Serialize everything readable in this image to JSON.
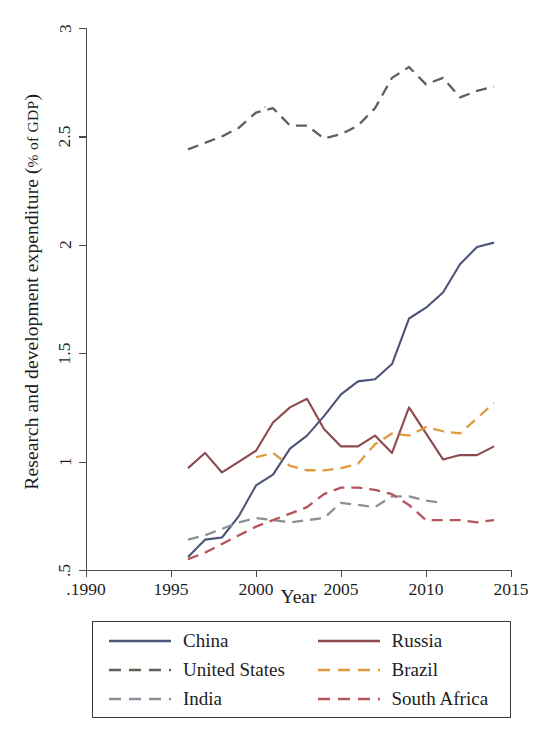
{
  "chart_data": {
    "type": "line",
    "title": "",
    "xlabel": "Year",
    "ylabel": "Research and development expenditure (% of GDP)",
    "ylabel_main": "Research and development expenditure (",
    "ylabel_smallcaps": "% of GDP",
    "ylabel_tail": ")",
    "xlim": [
      1990,
      2015
    ],
    "ylim": [
      0.5,
      3
    ],
    "grid": false,
    "legend_position": "bottom",
    "x_ticks": [
      ".1990",
      "1995",
      "2000",
      "2005",
      "2010",
      "2015"
    ],
    "x_tick_values": [
      1990,
      1995,
      2000,
      2005,
      2010,
      2015
    ],
    "y_ticks": [
      ".5",
      "1",
      "1.5",
      "2",
      "2.5",
      "3"
    ],
    "y_tick_values": [
      0.5,
      1,
      1.5,
      2,
      2.5,
      3
    ],
    "series": [
      {
        "name": "China",
        "color": "#4c5578",
        "style": "solid",
        "x": [
          1996,
          1997,
          1998,
          1999,
          2000,
          2001,
          2002,
          2003,
          2004,
          2005,
          2006,
          2007,
          2008,
          2009,
          2010,
          2011,
          2012,
          2013,
          2014
        ],
        "values": [
          0.56,
          0.64,
          0.65,
          0.75,
          0.89,
          0.94,
          1.06,
          1.12,
          1.21,
          1.31,
          1.37,
          1.38,
          1.45,
          1.66,
          1.71,
          1.78,
          1.91,
          1.99,
          2.01
        ]
      },
      {
        "name": "United States",
        "color": "#5d6052",
        "style": "dashed",
        "x": [
          1996,
          1997,
          1998,
          1999,
          2000,
          2001,
          2002,
          2003,
          2004,
          2005,
          2006,
          2007,
          2008,
          2009,
          2010,
          2011,
          2012,
          2013,
          2014
        ],
        "values": [
          2.44,
          2.47,
          2.5,
          2.54,
          2.61,
          2.63,
          2.55,
          2.55,
          2.49,
          2.51,
          2.55,
          2.63,
          2.77,
          2.82,
          2.74,
          2.77,
          2.68,
          2.71,
          2.73
        ]
      },
      {
        "name": "India",
        "color": "#8b8f99",
        "style": "dashed",
        "x": [
          1996,
          1997,
          1998,
          1999,
          2000,
          2001,
          2002,
          2003,
          2004,
          2005,
          2006,
          2007,
          2008,
          2009,
          2010,
          2011
        ],
        "values": [
          0.64,
          0.66,
          0.69,
          0.72,
          0.74,
          0.73,
          0.72,
          0.73,
          0.74,
          0.81,
          0.8,
          0.79,
          0.84,
          0.84,
          0.82,
          0.81
        ]
      },
      {
        "name": "Russia",
        "color": "#8c4a4e",
        "style": "solid",
        "x": [
          1996,
          1997,
          1998,
          1999,
          2000,
          2001,
          2002,
          2003,
          2004,
          2005,
          2006,
          2007,
          2008,
          2009,
          2010,
          2011,
          2012,
          2013,
          2014
        ],
        "values": [
          0.97,
          1.04,
          0.95,
          1.0,
          1.05,
          1.18,
          1.25,
          1.29,
          1.15,
          1.07,
          1.07,
          1.12,
          1.04,
          1.25,
          1.13,
          1.01,
          1.03,
          1.03,
          1.07
        ]
      },
      {
        "name": "Brazil",
        "color": "#e09a3e",
        "style": "dashed",
        "x": [
          2000,
          2001,
          2002,
          2003,
          2004,
          2005,
          2006,
          2007,
          2008,
          2009,
          2010,
          2011,
          2012,
          2013,
          2014
        ],
        "values": [
          1.02,
          1.04,
          0.98,
          0.96,
          0.96,
          0.97,
          0.99,
          1.08,
          1.13,
          1.12,
          1.16,
          1.14,
          1.13,
          1.2,
          1.27
        ]
      },
      {
        "name": "South Africa",
        "color": "#b4545c",
        "style": "dashed",
        "x": [
          1996,
          1997,
          1998,
          1999,
          2000,
          2001,
          2002,
          2003,
          2004,
          2005,
          2006,
          2007,
          2008,
          2009,
          2010,
          2011,
          2012,
          2013,
          2014
        ],
        "values": [
          0.55,
          0.58,
          0.62,
          0.66,
          0.7,
          0.73,
          0.76,
          0.79,
          0.85,
          0.88,
          0.88,
          0.87,
          0.85,
          0.8,
          0.73,
          0.73,
          0.73,
          0.72,
          0.73
        ]
      }
    ]
  },
  "legend": {
    "items": [
      {
        "label": "China",
        "color": "#4c5578",
        "style": "solid"
      },
      {
        "label": "Russia",
        "color": "#8c4a4e",
        "style": "solid"
      },
      {
        "label": "United States",
        "color": "#5d6052",
        "style": "dashed"
      },
      {
        "label": "Brazil",
        "color": "#e09a3e",
        "style": "dashed"
      },
      {
        "label": "India",
        "color": "#8b8f99",
        "style": "dashed"
      },
      {
        "label": "South Africa",
        "color": "#b4545c",
        "style": "dashed"
      }
    ]
  },
  "axes": {
    "x_title": "Year",
    "y_title_main": "Research and development expenditure (",
    "y_title_smallcaps": "% of GDP",
    "y_title_tail": ")"
  }
}
